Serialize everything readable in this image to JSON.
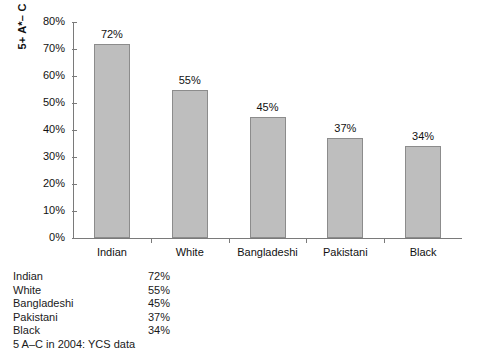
{
  "chart_data": {
    "type": "bar",
    "title": "",
    "xlabel": "",
    "ylabel": "5+ A*– C GCSE passes",
    "categories": [
      "Indian",
      "White",
      "Bangladeshi",
      "Pakistani",
      "Black"
    ],
    "values": [
      72,
      55,
      45,
      37,
      34
    ],
    "value_labels": [
      "72%",
      "55%",
      "45%",
      "37%",
      "34%"
    ],
    "ylim": [
      0,
      80
    ],
    "ytick_values": [
      0,
      10,
      20,
      30,
      40,
      50,
      60,
      70,
      80
    ],
    "ytick_labels": [
      "0%",
      "10%",
      "20%",
      "30%",
      "40%",
      "50%",
      "60%",
      "70%",
      "80%"
    ],
    "grid": false,
    "legend": false,
    "bar_fill": "#bebebe",
    "bar_edge": "#8c8c8c",
    "axis_color": "#7a7a7a"
  },
  "table": {
    "rows": [
      {
        "name": "Indian",
        "value": "72%"
      },
      {
        "name": "White",
        "value": "55%"
      },
      {
        "name": "Bangladeshi",
        "value": "45%"
      },
      {
        "name": "Pakistani",
        "value": "37%"
      },
      {
        "name": "Black",
        "value": "34%"
      }
    ]
  },
  "source_note": "5 A–C in 2004: YCS data"
}
